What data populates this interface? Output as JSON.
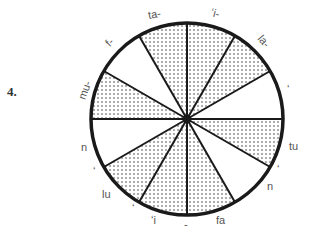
{
  "exercise": {
    "number": "4."
  },
  "diagram": {
    "type": "segmented-circle",
    "center": [
      187,
      119
    ],
    "radius": 96,
    "segment_count": 12,
    "geometry_note": "Wedges drawn at equal 30-degree spacing as an approximation; the original boundary angles were not measured and appear uneven.",
    "colors": {
      "outline": "#1a1a1a",
      "dot": "#333333",
      "background": "#ffffff"
    },
    "segments": [
      {
        "index": 0,
        "start_deg": 0,
        "end_deg": 30,
        "fill": "dotted"
      },
      {
        "index": 1,
        "start_deg": 30,
        "end_deg": 60,
        "fill": "dotted"
      },
      {
        "index": 2,
        "start_deg": 60,
        "end_deg": 90,
        "fill": "white"
      },
      {
        "index": 3,
        "start_deg": 90,
        "end_deg": 120,
        "fill": "dotted"
      },
      {
        "index": 4,
        "start_deg": 120,
        "end_deg": 150,
        "fill": "white"
      },
      {
        "index": 5,
        "start_deg": 150,
        "end_deg": 180,
        "fill": "dotted"
      },
      {
        "index": 6,
        "start_deg": 180,
        "end_deg": 210,
        "fill": "dotted"
      },
      {
        "index": 7,
        "start_deg": 210,
        "end_deg": 240,
        "fill": "dotted"
      },
      {
        "index": 8,
        "start_deg": 240,
        "end_deg": 270,
        "fill": "white"
      },
      {
        "index": 9,
        "start_deg": 270,
        "end_deg": 300,
        "fill": "dotted"
      },
      {
        "index": 10,
        "start_deg": 300,
        "end_deg": 330,
        "fill": "white"
      },
      {
        "index": 11,
        "start_deg": 330,
        "end_deg": 360,
        "fill": "dotted"
      }
    ],
    "labels": [
      {
        "text": "ta-",
        "x": 148,
        "y": 8,
        "rotate": -10
      },
      {
        "text": "ʻi-",
        "x": 211,
        "y": 7,
        "rotate": 15
      },
      {
        "text": "la-",
        "x": 258,
        "y": 35,
        "rotate": 50
      },
      {
        "text": "ʻ",
        "x": 287,
        "y": 83,
        "rotate": 0
      },
      {
        "text": "tu",
        "x": 289,
        "y": 140,
        "rotate": 0
      },
      {
        "text": "ʻ",
        "x": 277,
        "y": 163,
        "rotate": 0
      },
      {
        "text": "n",
        "x": 267,
        "y": 180,
        "rotate": 0
      },
      {
        "text": "fa",
        "x": 216,
        "y": 214,
        "rotate": 0
      },
      {
        "text": "-",
        "x": 184,
        "y": 218,
        "rotate": 0
      },
      {
        "text": "ʻi",
        "x": 151,
        "y": 214,
        "rotate": 0
      },
      {
        "text": "ʻ",
        "x": 132,
        "y": 202,
        "rotate": 0
      },
      {
        "text": "lu",
        "x": 102,
        "y": 188,
        "rotate": 0
      },
      {
        "text": "ʻ",
        "x": 93,
        "y": 165,
        "rotate": 0
      },
      {
        "text": "n",
        "x": 81,
        "y": 141,
        "rotate": 0
      },
      {
        "text": "mu-",
        "x": 75,
        "y": 84,
        "rotate": -70
      },
      {
        "text": "f-",
        "x": 106,
        "y": 36,
        "rotate": -45
      }
    ]
  }
}
